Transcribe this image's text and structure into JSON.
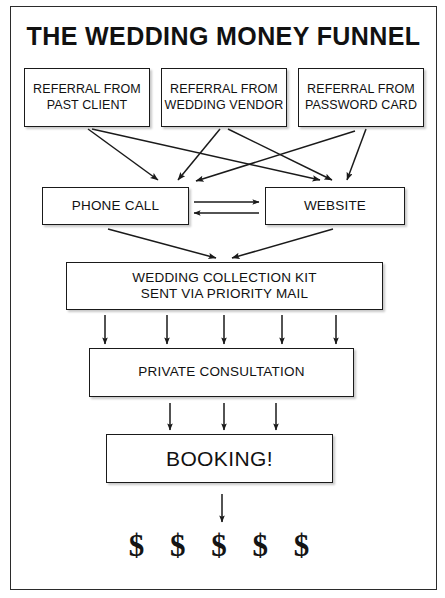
{
  "diagram": {
    "title": "THE WEDDING MONEY FUNNEL",
    "nodes": {
      "referral_past_client": {
        "line1": "REFERRAL FROM",
        "line2": "PAST CLIENT"
      },
      "referral_wedding_vendor": {
        "line1": "REFERRAL FROM",
        "line2": "WEDDING VENDOR"
      },
      "referral_password_card": {
        "line1": "REFERRAL FROM",
        "line2": "PASSWORD CARD"
      },
      "phone_call": {
        "label": "PHONE CALL"
      },
      "website": {
        "label": "WEBSITE"
      },
      "collection_kit": {
        "line1": "WEDDING COLLECTION KIT",
        "line2": "SENT VIA PRIORITY MAIL"
      },
      "private_consultation": {
        "label": "PRIVATE CONSULTATION"
      },
      "booking": {
        "label": "BOOKING!"
      },
      "money": {
        "label": "$ $ $ $ $"
      }
    },
    "colors": {
      "frame_border": "#2b2b2b",
      "node_border": "#1a1a1a",
      "text": "#111111",
      "background": "#ffffff",
      "arrow": "#1a1a1a"
    },
    "flow": [
      {
        "from": "referral_past_client",
        "to": "phone_call"
      },
      {
        "from": "referral_past_client",
        "to": "website"
      },
      {
        "from": "referral_wedding_vendor",
        "to": "phone_call"
      },
      {
        "from": "referral_wedding_vendor",
        "to": "website"
      },
      {
        "from": "referral_password_card",
        "to": "phone_call"
      },
      {
        "from": "referral_password_card",
        "to": "website"
      },
      {
        "from": "phone_call",
        "to": "website"
      },
      {
        "from": "website",
        "to": "phone_call"
      },
      {
        "from": "phone_call",
        "to": "collection_kit"
      },
      {
        "from": "website",
        "to": "collection_kit"
      },
      {
        "from": "collection_kit",
        "to": "private_consultation"
      },
      {
        "from": "private_consultation",
        "to": "booking"
      },
      {
        "from": "booking",
        "to": "money"
      }
    ]
  }
}
